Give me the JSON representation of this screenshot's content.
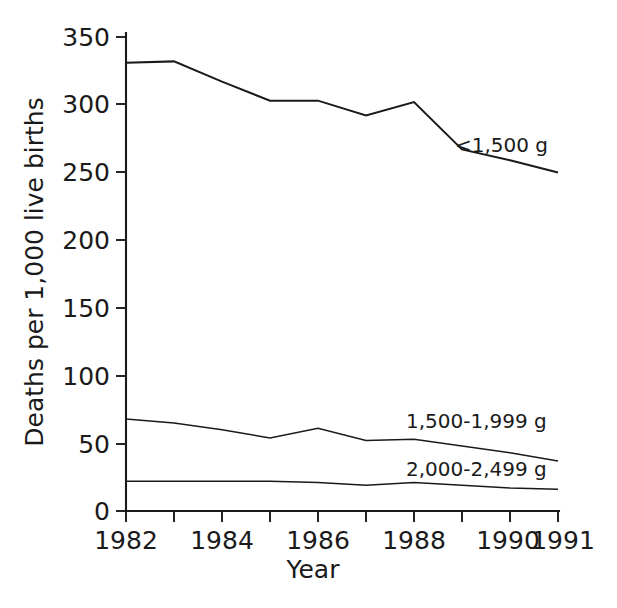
{
  "chart_data": {
    "type": "line",
    "title": "",
    "xlabel": "Year",
    "ylabel": "Deaths per 1,000 live births",
    "x": [
      1982,
      1983,
      1984,
      1985,
      1986,
      1987,
      1988,
      1989,
      1990,
      1991
    ],
    "xlim": [
      1982,
      1991
    ],
    "ylim": [
      0,
      350
    ],
    "yticks": [
      0,
      50,
      100,
      150,
      200,
      250,
      300,
      350
    ],
    "ytick_labels": [
      "0",
      "50",
      "100",
      "150",
      "200",
      "250",
      "300",
      "350"
    ],
    "xticks": [
      1982,
      1983,
      1984,
      1985,
      1986,
      1987,
      1988,
      1989,
      1990,
      1991
    ],
    "xtick_labels": [
      "1982",
      "",
      "1984",
      "",
      "1986",
      "",
      "1988",
      "",
      "1990",
      "1991"
    ],
    "grid": false,
    "legend_position": "inline-right",
    "series": [
      {
        "name": "<1,500 g",
        "label": "<1,500 g",
        "values": [
          331,
          332,
          317,
          303,
          303,
          292,
          302,
          267,
          259,
          250
        ]
      },
      {
        "name": "1,500-1,999 g",
        "label": "1,500-1,999 g",
        "values": [
          68,
          65,
          60,
          54,
          61,
          52,
          53,
          48,
          43,
          37
        ]
      },
      {
        "name": "2,000-2,499 g",
        "label": "2,000-2,499 g",
        "values": [
          22,
          22,
          22,
          22,
          21,
          19,
          21,
          19,
          17,
          16
        ]
      }
    ]
  },
  "axes": {
    "y_title": "Deaths per 1,000 live births",
    "x_title": "Year"
  },
  "caption": {
    "text": ""
  }
}
